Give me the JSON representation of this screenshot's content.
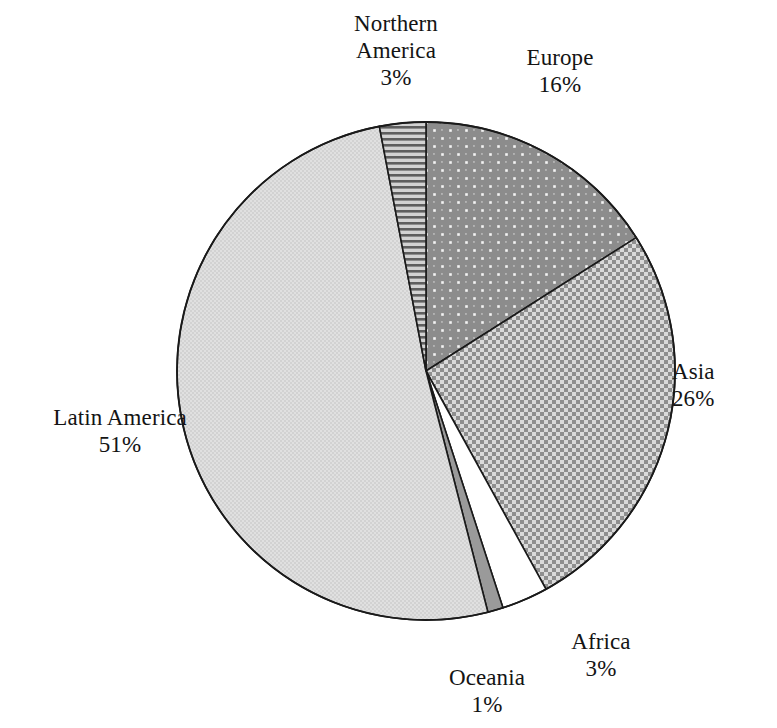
{
  "chart_data": {
    "type": "pie",
    "title": "",
    "subtitle": "",
    "xlabel": "",
    "ylabel": "",
    "legend_position": "none",
    "grid": false,
    "value_unit": "%",
    "start_angle_deg": 0,
    "direction": "clockwise",
    "categories": [
      "Europe",
      "Asia",
      "Africa",
      "Oceania",
      "Latin America",
      "Northern America"
    ],
    "values": [
      16,
      26,
      3,
      1,
      51,
      3
    ],
    "slices": [
      {
        "label": "Europe",
        "value": 16,
        "value_text": "16%",
        "fill_style": "dark-gray-with-white-dots",
        "base_color": "#8c8c8c",
        "pattern_color": "#f2f2f2",
        "edge_color": "#1a1a1a",
        "start_deg": 0,
        "end_deg": 57.6
      },
      {
        "label": "Asia",
        "value": 26,
        "value_text": "26%",
        "fill_style": "medium-gray-checkerboard",
        "base_color": "#d0d0d0",
        "pattern_color": "#8f8f8f",
        "edge_color": "#1a1a1a",
        "start_deg": 57.6,
        "end_deg": 151.2
      },
      {
        "label": "Africa",
        "value": 3,
        "value_text": "3%",
        "fill_style": "solid-white",
        "base_color": "#ffffff",
        "pattern_color": "#ffffff",
        "edge_color": "#1a1a1a",
        "start_deg": 151.2,
        "end_deg": 162.0
      },
      {
        "label": "Oceania",
        "value": 1,
        "value_text": "1%",
        "fill_style": "solid-dark-gray",
        "base_color": "#9a9a9a",
        "pattern_color": "#9a9a9a",
        "edge_color": "#1a1a1a",
        "start_deg": 162.0,
        "end_deg": 165.6
      },
      {
        "label": "Latin America",
        "value": 51,
        "value_text": "51%",
        "fill_style": "light-gray-fine-texture",
        "base_color": "#dcdcdc",
        "pattern_color": "#cfcfcf",
        "edge_color": "#1a1a1a",
        "start_deg": 165.6,
        "end_deg": 349.2
      },
      {
        "label": "Northern America",
        "value": 3,
        "value_text": "3%",
        "fill_style": "horizontal-stripes",
        "base_color": "#c4c4c4",
        "pattern_color": "#636363",
        "edge_color": "#1a1a1a",
        "start_deg": 349.2,
        "end_deg": 360.0
      }
    ]
  },
  "labels": {
    "northern_america": {
      "name_line1": "Northern",
      "name_line2": "America",
      "pct": "3%"
    },
    "europe": {
      "name": "Europe",
      "pct": "16%"
    },
    "asia": {
      "name": "Asia",
      "pct": "26%"
    },
    "latin_america": {
      "name": "Latin America",
      "pct": "51%"
    },
    "oceania": {
      "name": "Oceania",
      "pct": "1%"
    },
    "africa": {
      "name": "Africa",
      "pct": "3%"
    }
  },
  "geometry": {
    "center_x": 426,
    "center_y": 371,
    "radius": 249
  },
  "colors": {
    "background": "#ffffff",
    "text": "#141414",
    "slice_edge": "#1a1a1a"
  }
}
